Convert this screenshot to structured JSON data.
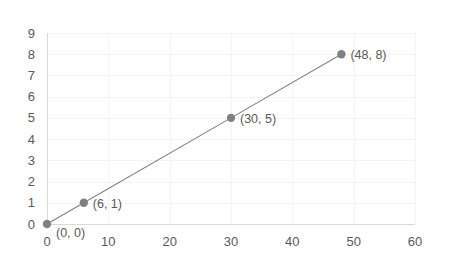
{
  "chart_data": {
    "type": "line",
    "title": "",
    "subtitle": "",
    "xlabel": "",
    "ylabel": "",
    "xlim": [
      0,
      60
    ],
    "ylim": [
      0,
      9
    ],
    "grid": true,
    "legend": false,
    "legend_position": "none",
    "x_ticks": [
      0,
      10,
      20,
      30,
      40,
      50,
      60
    ],
    "x_tick_labels": [
      "0",
      "10",
      "20",
      "30",
      "40",
      "50",
      "60"
    ],
    "y_ticks": [
      0,
      1,
      2,
      3,
      4,
      5,
      6,
      7,
      8,
      9
    ],
    "y_tick_labels": [
      "0",
      "1",
      "2",
      "3",
      "4",
      "5",
      "6",
      "7",
      "8",
      "9"
    ],
    "x": [
      0,
      6,
      30,
      48
    ],
    "values": [
      0,
      1,
      5,
      8
    ],
    "points": [
      {
        "x": 0,
        "y": 0,
        "label": "(0, 0)"
      },
      {
        "x": 6,
        "y": 1,
        "label": "(6, 1)"
      },
      {
        "x": 30,
        "y": 5,
        "label": "(30, 5)"
      },
      {
        "x": 48,
        "y": 8,
        "label": "(48, 8)"
      }
    ],
    "series": [
      {
        "name": "",
        "x": [
          0,
          6,
          30,
          48
        ],
        "values": [
          0,
          1,
          5,
          8
        ],
        "marker": "circle",
        "color": "#808080"
      }
    ],
    "annotations": [
      "(0, 0)",
      "(6, 1)",
      "(30, 5)",
      "(48, 8)"
    ],
    "colors": {
      "series": "#808080",
      "marker": "#808080",
      "tick_label": "#595959",
      "point_label": "#595959",
      "gridline": "#F2F4F7",
      "axis_line": "#D9D9D9",
      "plot_border": "#FAFBFC",
      "background": "#FFFFFF"
    }
  }
}
